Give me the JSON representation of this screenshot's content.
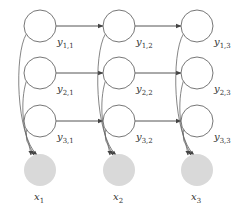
{
  "diagram": {
    "type": "graphical-model",
    "colors": {
      "node_stroke": "#777777",
      "node_fill_hidden": "#ffffff",
      "node_fill_observed": "#d9d9d9",
      "edge": "#555555"
    },
    "hidden_nodes": [
      {
        "id": "y11",
        "var": "y",
        "sub": "1,1",
        "cx": 40,
        "cy": 26
      },
      {
        "id": "y12",
        "var": "y",
        "sub": "1,2",
        "cx": 119,
        "cy": 26
      },
      {
        "id": "y13",
        "var": "y",
        "sub": "1,3",
        "cx": 197,
        "cy": 26
      },
      {
        "id": "y21",
        "var": "y",
        "sub": "2,1",
        "cx": 40,
        "cy": 73
      },
      {
        "id": "y22",
        "var": "y",
        "sub": "2,2",
        "cx": 119,
        "cy": 73
      },
      {
        "id": "y23",
        "var": "y",
        "sub": "2,3",
        "cx": 197,
        "cy": 73
      },
      {
        "id": "y31",
        "var": "y",
        "sub": "3,1",
        "cx": 40,
        "cy": 121
      },
      {
        "id": "y32",
        "var": "y",
        "sub": "3,2",
        "cx": 119,
        "cy": 121
      },
      {
        "id": "y33",
        "var": "y",
        "sub": "3,3",
        "cx": 197,
        "cy": 121
      }
    ],
    "observed_nodes": [
      {
        "id": "x1",
        "var": "x",
        "sub": "1",
        "cx": 40,
        "cy": 170
      },
      {
        "id": "x2",
        "var": "x",
        "sub": "2",
        "cx": 119,
        "cy": 170
      },
      {
        "id": "x3",
        "var": "x",
        "sub": "3",
        "cx": 197,
        "cy": 170
      }
    ],
    "edges_horizontal": [
      [
        "y11",
        "y12"
      ],
      [
        "y12",
        "y13"
      ],
      [
        "y21",
        "y22"
      ],
      [
        "y22",
        "y23"
      ],
      [
        "y31",
        "y32"
      ],
      [
        "y32",
        "y33"
      ]
    ],
    "edges_to_observed": [
      [
        "y11",
        "x1"
      ],
      [
        "y21",
        "x1"
      ],
      [
        "y31",
        "x1"
      ],
      [
        "y12",
        "x2"
      ],
      [
        "y22",
        "x2"
      ],
      [
        "y32",
        "x2"
      ],
      [
        "y13",
        "x3"
      ],
      [
        "y23",
        "x3"
      ],
      [
        "y33",
        "x3"
      ]
    ]
  }
}
